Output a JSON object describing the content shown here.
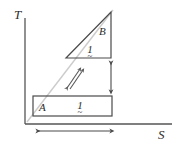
{
  "figure": {
    "type": "ts-diagram",
    "background_color": "#ffffff",
    "line_color": "#4a4a4a",
    "text_color": "#2b2b2b"
  },
  "axes": {
    "y_label": "T",
    "x_label": "S",
    "origin": {
      "x": 25,
      "y": 124
    },
    "y_axis_top": 18,
    "x_axis_right": 172
  },
  "regions": [
    {
      "id": "A",
      "shape": "rectangle",
      "label": "A",
      "value_label": "1",
      "value_accent": "~",
      "x": 33,
      "y": 96,
      "width": 79,
      "height": 20
    },
    {
      "id": "B",
      "shape": "triangle",
      "label": "B",
      "value_label": "1",
      "value_accent": "~",
      "apex": {
        "x": 111,
        "y": 12
      },
      "base_left": {
        "x": 66,
        "y": 58
      },
      "base_right": {
        "x": 111,
        "y": 58
      }
    }
  ],
  "guide_line": {
    "name": "isentropic-diagonal",
    "from": {
      "x": 27,
      "y": 122
    },
    "to": {
      "x": 113,
      "y": 10
    },
    "color": "#c9c9c9"
  },
  "annotations": [
    {
      "name": "diagonal-double-arrow",
      "type": "double-arrow",
      "direction": "diagonal-up-right",
      "from": {
        "x": 66,
        "y": 88
      },
      "to": {
        "x": 80,
        "y": 68
      }
    },
    {
      "name": "vertical-dimension-arrow",
      "type": "double-arrow",
      "direction": "vertical",
      "from": {
        "x": 111,
        "y": 62
      },
      "to": {
        "x": 111,
        "y": 92
      }
    },
    {
      "name": "horizontal-dimension-arrow",
      "type": "double-arrow",
      "direction": "horizontal",
      "from": {
        "x": 38,
        "y": 131
      },
      "to": {
        "x": 112,
        "y": 131
      }
    }
  ]
}
